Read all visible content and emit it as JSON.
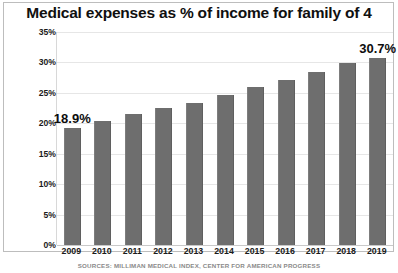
{
  "chart_data": {
    "type": "bar",
    "title": "Medical expenses as % of income for family of 4",
    "xlabel": "",
    "ylabel": "",
    "ylim": [
      0,
      35
    ],
    "ytick_step": 5,
    "ytick_labels": [
      "0%",
      "5%",
      "10%",
      "15%",
      "20%",
      "25%",
      "30%",
      "35%"
    ],
    "ytick_values": [
      0,
      5,
      10,
      15,
      20,
      25,
      30,
      35
    ],
    "grid": true,
    "legend": "none",
    "bar_color": "#6e6e6e",
    "categories": [
      "2009",
      "2010",
      "2011",
      "2012",
      "2013",
      "2014",
      "2015",
      "2016",
      "2017",
      "2018",
      "2019"
    ],
    "values": [
      19.2,
      20.3,
      21.5,
      22.5,
      23.4,
      24.7,
      26.0,
      27.1,
      28.5,
      29.9,
      30.7
    ],
    "annotations": [
      {
        "category": "2009",
        "text": "18.9%"
      },
      {
        "category": "2019",
        "text": "30.7%"
      }
    ],
    "source": "SOURCES: MILLIMAN MEDICAL INDEX, CENTER FOR AMERICAN PROGRESS"
  }
}
